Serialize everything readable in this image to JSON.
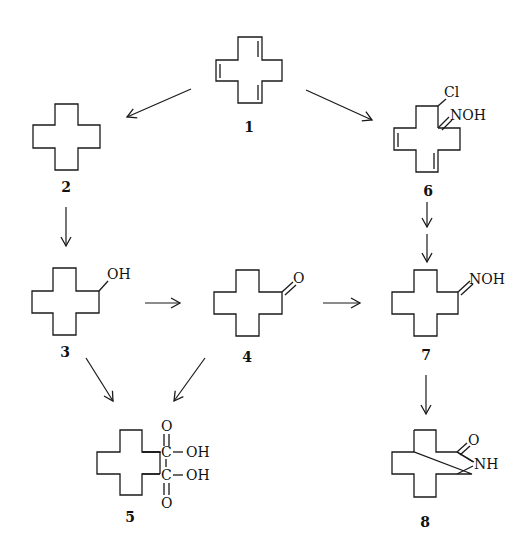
{
  "colors": {
    "ink": "#1a1a1a",
    "background": "#ffffff"
  },
  "compounds": [
    {
      "id": "1",
      "label": "1",
      "description": "cyclododecatriene (three C=C double bonds)",
      "substituents": []
    },
    {
      "id": "2",
      "label": "2",
      "description": "cyclododecane",
      "substituents": []
    },
    {
      "id": "3",
      "label": "3",
      "description": "cyclododecanol",
      "substituents": [
        "OH"
      ]
    },
    {
      "id": "4",
      "label": "4",
      "description": "cyclododecanone",
      "substituents": [
        "O"
      ]
    },
    {
      "id": "5",
      "label": "5",
      "description": "dodecanedioic acid",
      "substituents": [
        "O",
        "C",
        "OH",
        "C",
        "OH",
        "O"
      ]
    },
    {
      "id": "6",
      "label": "6",
      "description": "chloro oxime of cyclododecadiene",
      "substituents": [
        "Cl",
        "NOH"
      ]
    },
    {
      "id": "7",
      "label": "7",
      "description": "cyclododecanone oxime",
      "substituents": [
        "NOH"
      ]
    },
    {
      "id": "8",
      "label": "8",
      "description": "laurolactam",
      "substituents": [
        "O",
        "NH"
      ]
    }
  ],
  "atoms": {
    "c3_oh": "OH",
    "c4_o": "O",
    "c5_o_top": "O",
    "c5_c_top": "C",
    "c5_oh_top": "OH",
    "c5_c_bottom": "C",
    "c5_oh_bottom": "OH",
    "c5_o_bottom": "O",
    "c6_cl": "Cl",
    "c6_noh": "NOH",
    "c7_noh": "NOH",
    "c8_o": "O",
    "c8_nh": "NH"
  },
  "arrows": [
    {
      "from": "1",
      "to": "2"
    },
    {
      "from": "1",
      "to": "6"
    },
    {
      "from": "2",
      "to": "3"
    },
    {
      "from": "3",
      "to": "4"
    },
    {
      "from": "4",
      "to": "7"
    },
    {
      "from": "6",
      "to": "7",
      "double_step": true
    },
    {
      "from": "3",
      "to": "5"
    },
    {
      "from": "4",
      "to": "5"
    },
    {
      "from": "7",
      "to": "8"
    }
  ]
}
